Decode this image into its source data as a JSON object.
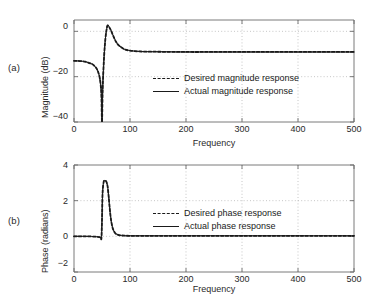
{
  "figure": {
    "panels": [
      {
        "tag": "(a)",
        "ylabel": "Magnitude (dB)",
        "xlabel": "Frequency",
        "yticks": [
          "0",
          "−20",
          "−40"
        ],
        "xticks": [
          "0",
          "100",
          "200",
          "300",
          "400",
          "500"
        ],
        "legend": [
          {
            "label": "Desired magnitude response",
            "style": "dashed"
          },
          {
            "label": "Actual magnitude response",
            "style": "solid"
          }
        ]
      },
      {
        "tag": "(b)",
        "ylabel": "Phase (radians)",
        "xlabel": "Frequency",
        "yticks": [
          "4",
          "2",
          "0",
          "−2"
        ],
        "xticks": [
          "0",
          "100",
          "200",
          "300",
          "400",
          "500"
        ],
        "legend": [
          {
            "label": "Desired phase response",
            "style": "dashed"
          },
          {
            "label": "Actual phase response",
            "style": "solid"
          }
        ]
      }
    ],
    "colors": {
      "curve": "#1a1a1a",
      "axis": "#6b6b6b",
      "grid": "#b8b8b8",
      "background": "#ffffff"
    }
  },
  "chart_data": [
    {
      "type": "line",
      "title": "",
      "panel": "(a)",
      "xlabel": "Frequency",
      "ylabel": "Magnitude (dB)",
      "xlim": [
        0,
        500
      ],
      "ylim": [
        -40,
        5
      ],
      "xticks": [
        0,
        100,
        200,
        300,
        400,
        500
      ],
      "yticks": [
        0,
        -20,
        -40
      ],
      "grid": true,
      "legend_position": "center",
      "series": [
        {
          "name": "Desired magnitude response",
          "style": "dashed",
          "x": [
            0,
            10,
            20,
            30,
            35,
            40,
            43,
            46,
            48,
            49,
            50,
            51,
            52,
            54,
            56,
            58,
            60,
            63,
            66,
            70,
            75,
            80,
            90,
            100,
            120,
            150,
            200,
            250,
            300,
            350,
            400,
            450,
            500
          ],
          "y": [
            -13.0,
            -13.1,
            -13.4,
            -14.2,
            -14.9,
            -16.3,
            -17.8,
            -20.6,
            -24.5,
            -29.0,
            -40.0,
            -28.0,
            -20.0,
            -10.0,
            -3.5,
            0.5,
            2.6,
            1.8,
            0.4,
            -2.0,
            -4.6,
            -6.2,
            -7.9,
            -8.5,
            -8.9,
            -9.0,
            -9.1,
            -9.1,
            -9.1,
            -9.1,
            -9.1,
            -9.1,
            -9.1
          ]
        },
        {
          "name": "Actual magnitude response",
          "style": "solid",
          "x": [
            0,
            10,
            20,
            30,
            35,
            40,
            43,
            46,
            48,
            49,
            50,
            51,
            52,
            54,
            56,
            58,
            60,
            63,
            66,
            70,
            75,
            80,
            90,
            100,
            120,
            150,
            200,
            250,
            300,
            350,
            400,
            450,
            500
          ],
          "y": [
            -13.0,
            -13.1,
            -13.4,
            -14.2,
            -14.9,
            -16.3,
            -17.8,
            -20.6,
            -24.5,
            -29.0,
            -40.0,
            -28.0,
            -20.0,
            -10.0,
            -3.5,
            0.5,
            2.7,
            1.9,
            0.5,
            -1.9,
            -4.5,
            -6.1,
            -7.9,
            -8.5,
            -8.9,
            -9.0,
            -9.1,
            -9.1,
            -9.1,
            -9.1,
            -9.1,
            -9.1,
            -9.1
          ]
        }
      ]
    },
    {
      "type": "line",
      "title": "",
      "panel": "(b)",
      "xlabel": "Frequency",
      "ylabel": "Phase (radians)",
      "xlim": [
        0,
        500
      ],
      "ylim": [
        -2,
        4
      ],
      "xticks": [
        0,
        100,
        200,
        300,
        400,
        500
      ],
      "yticks": [
        4,
        2,
        0,
        -2
      ],
      "grid": true,
      "legend_position": "center",
      "series": [
        {
          "name": "Desired phase response",
          "style": "dashed",
          "x": [
            0,
            20,
            40,
            46,
            48,
            49,
            50,
            51,
            53,
            55,
            57,
            58,
            60,
            62,
            64,
            66,
            68,
            70,
            73,
            76,
            80,
            85,
            90,
            100,
            120,
            160,
            200,
            300,
            400,
            500
          ],
          "y": [
            0.0,
            0.0,
            -0.02,
            -0.05,
            -0.08,
            -0.1,
            0.9,
            2.4,
            3.05,
            3.12,
            3.1,
            3.05,
            2.8,
            2.2,
            1.5,
            0.95,
            0.6,
            0.38,
            0.2,
            0.12,
            0.07,
            0.05,
            0.04,
            0.03,
            0.03,
            0.03,
            0.03,
            0.03,
            0.03,
            0.03
          ]
        },
        {
          "name": "Actual phase response",
          "style": "solid",
          "x": [
            0,
            20,
            40,
            46,
            48,
            49,
            50,
            51,
            53,
            55,
            57,
            58,
            60,
            62,
            64,
            66,
            68,
            70,
            73,
            76,
            80,
            85,
            90,
            100,
            120,
            160,
            200,
            300,
            400,
            500
          ],
          "y": [
            0.0,
            0.0,
            -0.02,
            -0.05,
            -0.08,
            -0.1,
            0.9,
            2.4,
            3.06,
            3.13,
            3.11,
            3.06,
            2.8,
            2.2,
            1.5,
            0.95,
            0.6,
            0.38,
            0.2,
            0.12,
            0.07,
            0.05,
            0.04,
            0.03,
            0.03,
            0.03,
            0.03,
            0.03,
            0.03,
            0.03
          ]
        }
      ]
    }
  ]
}
